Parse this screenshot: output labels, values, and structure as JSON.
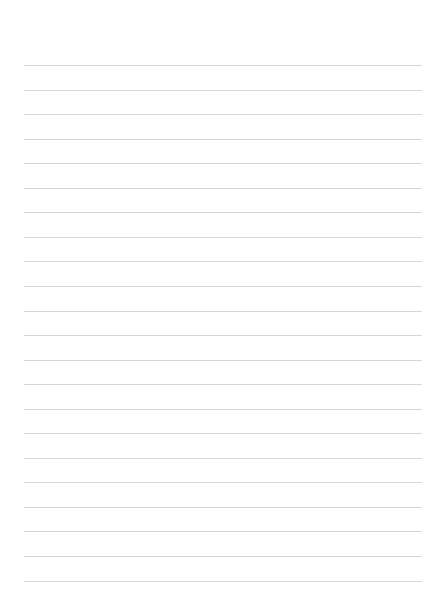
{
  "page": {
    "type": "lined-paper",
    "background_color": "#ffffff",
    "line_color": "#d6d6d6",
    "line_count": 22,
    "first_line_y": 65,
    "line_spacing": 24.55,
    "line_left": 24,
    "line_width": 398
  }
}
